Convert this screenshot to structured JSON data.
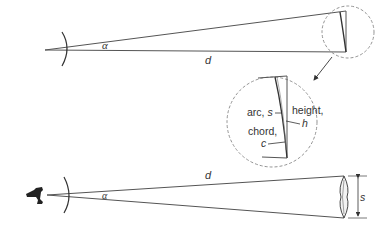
{
  "diagram": {
    "top_figure": {
      "angle_label": "α",
      "distance_label": "d"
    },
    "magnified_inset": {
      "arc_label": "arc, ",
      "arc_symbol": "s",
      "chord_label": "chord,",
      "chord_symbol": "c",
      "height_label": "height,",
      "height_symbol": "h"
    },
    "bottom_figure": {
      "angle_label": "α",
      "distance_label": "d",
      "size_label": "s"
    },
    "colors": {
      "line": "#555555",
      "dashed": "#888888",
      "text": "#333333"
    }
  }
}
